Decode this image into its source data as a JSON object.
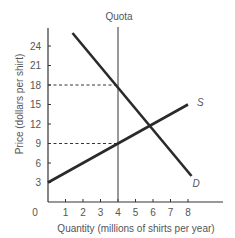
{
  "chart_data": {
    "type": "line",
    "title": "",
    "xlabel": "Quantity (millions of shirts per year)",
    "ylabel": "Price (dollars per shirt)",
    "xlim": [
      0,
      9.5
    ],
    "ylim": [
      0,
      27
    ],
    "x_ticks": [
      "0",
      "1",
      "2",
      "3",
      "4",
      "5",
      "6",
      "7",
      "8"
    ],
    "y_ticks": [
      "3",
      "6",
      "9",
      "12",
      "15",
      "18",
      "21",
      "24"
    ],
    "grid": false,
    "series": [
      {
        "name": "D",
        "label": "D",
        "points": [
          [
            1.4,
            26
          ],
          [
            8.2,
            4
          ]
        ]
      },
      {
        "name": "S",
        "label": "S",
        "points": [
          [
            0,
            3
          ],
          [
            8,
            15
          ]
        ]
      }
    ],
    "annotations": [
      {
        "type": "vertical-line",
        "label": "Quota",
        "x": 4
      },
      {
        "type": "dashed-line",
        "y": 18,
        "x_from": 0,
        "x_to": 4
      },
      {
        "type": "dashed-line",
        "y": 9,
        "x_from": 0,
        "x_to": 4
      }
    ],
    "equilibrium": {
      "x": 6,
      "y": 12
    }
  },
  "labels": {
    "quota": "Quota",
    "supply": "S",
    "demand": "D",
    "origin": "0",
    "xlabel": "Quantity (millions of shirts per year)",
    "ylabel": "Price (dollars per shirt)"
  }
}
